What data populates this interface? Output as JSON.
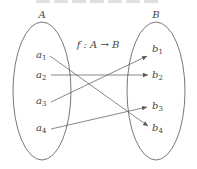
{
  "diagram": {
    "type": "function-mapping",
    "title": "f : A → B",
    "sets": [
      {
        "name": "A",
        "cx": 42,
        "cy": 91,
        "rx": 29,
        "ry": 69,
        "elements": [
          {
            "label": "a",
            "sub": "1",
            "x": 36,
            "y": 58
          },
          {
            "label": "a",
            "sub": "2",
            "x": 36,
            "y": 78
          },
          {
            "label": "a",
            "sub": "3",
            "x": 36,
            "y": 104
          },
          {
            "label": "a",
            "sub": "4",
            "x": 36,
            "y": 131
          }
        ]
      },
      {
        "name": "B",
        "cx": 156,
        "cy": 91,
        "rx": 29,
        "ry": 69,
        "elements": [
          {
            "label": "b",
            "sub": "1",
            "x": 152,
            "y": 52
          },
          {
            "label": "b",
            "sub": "2",
            "x": 152,
            "y": 78
          },
          {
            "label": "b",
            "sub": "3",
            "x": 152,
            "y": 109
          },
          {
            "label": "b",
            "sub": "4",
            "x": 152,
            "y": 131
          }
        ]
      }
    ],
    "mappings": [
      {
        "from": "a1",
        "to": "b4",
        "x1": 50,
        "y1": 56,
        "x2": 148,
        "y2": 126
      },
      {
        "from": "a2",
        "to": "b2",
        "x1": 51,
        "y1": 75,
        "x2": 148,
        "y2": 75
      },
      {
        "from": "a3",
        "to": "b1",
        "x1": 51,
        "y1": 102,
        "x2": 147,
        "y2": 56
      },
      {
        "from": "a4",
        "to": "b3",
        "x1": 51,
        "y1": 129,
        "x2": 147,
        "y2": 107
      }
    ],
    "colors": {
      "stroke": "#555555",
      "text": "#444444",
      "background": "#ffffff"
    }
  }
}
